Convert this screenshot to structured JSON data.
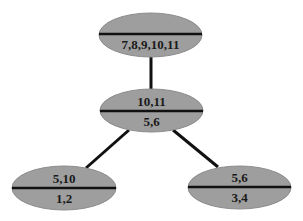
{
  "diagram": {
    "type": "tree",
    "colors": {
      "node_fill": "#9e9e9e",
      "node_stroke": "#8a8a8a",
      "divider": "#111111",
      "edge": "#111111",
      "text": "#1a1a1a"
    },
    "nodes": [
      {
        "id": "root",
        "top": "",
        "bottom": "7,8,9,10,11",
        "cx": 150.5,
        "cy": 35,
        "rx": 51.5,
        "ry": 22,
        "divider_y": 34
      },
      {
        "id": "middle",
        "top": "10,11",
        "bottom": "5,6",
        "cx": 151.5,
        "cy": 110.5,
        "rx": 51.5,
        "ry": 21.5,
        "divider_y": 111
      },
      {
        "id": "left",
        "top": "5,10",
        "bottom": "1,2",
        "cx": 64,
        "cy": 188,
        "rx": 52,
        "ry": 22,
        "divider_y": 188
      },
      {
        "id": "right",
        "top": "5,6",
        "bottom": "3,4",
        "cx": 239.5,
        "cy": 187.5,
        "rx": 51.5,
        "ry": 21.5,
        "divider_y": 187
      }
    ],
    "edges": [
      {
        "from": "root",
        "to": "middle",
        "x1": 151,
        "y1": 57,
        "x2": 151,
        "y2": 89
      },
      {
        "from": "middle",
        "to": "left",
        "x1": 129,
        "y1": 130,
        "x2": 86,
        "y2": 168
      },
      {
        "from": "middle",
        "to": "right",
        "x1": 173,
        "y1": 130,
        "x2": 218,
        "y2": 167
      }
    ]
  }
}
